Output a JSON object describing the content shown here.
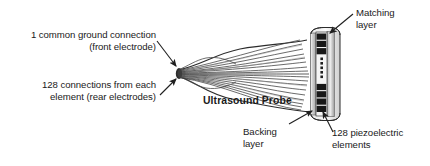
{
  "figure": {
    "background_color": "#ffffff",
    "text_color": "#1a1a1a",
    "width": 430,
    "height": 166
  },
  "labels": {
    "ground_connection": "1 common ground connection\n(front electrode)",
    "element_connections": "128 connections from each\nelement (rear electrodes)",
    "probe": "Ultrasound Probe",
    "matching_layer": "Matching\nlayer",
    "backing_layer": "Backing\nlayer",
    "piezoelectric_elements": "128 piezoelectric\nelements"
  },
  "diagram": {
    "stroke_color": "#2b2b2b",
    "element_fill": "#1c1c1c",
    "backing_fill": "#c9c9c9",
    "matching_fill": "#d8d8d8",
    "housing_fill": "#f2f2f2",
    "piezo_element_count": 12,
    "cable_wire_count": 18,
    "cable_tip": {
      "x": 178,
      "y": 72
    },
    "probe_head": {
      "x": 315,
      "y": 32,
      "width": 22,
      "height": 84
    }
  },
  "annotations": [
    {
      "name": "ground-connection-arrow",
      "from": [
        158,
        42
      ],
      "to": [
        177,
        66
      ]
    },
    {
      "name": "element-connections-arrow",
      "from": [
        160,
        96
      ],
      "to": [
        177,
        78
      ]
    },
    {
      "name": "matching-layer-arrow",
      "from": [
        352,
        14
      ],
      "to": [
        329,
        34
      ]
    },
    {
      "name": "backing-layer-arrow",
      "from": [
        290,
        124
      ],
      "to": [
        313,
        110
      ]
    },
    {
      "name": "piezo-elements-arrow",
      "from": [
        333,
        131
      ],
      "to": [
        322,
        110
      ]
    }
  ]
}
